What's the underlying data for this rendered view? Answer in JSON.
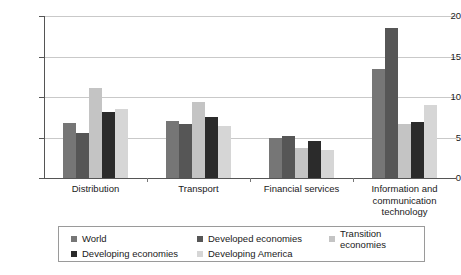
{
  "chart_data": {
    "type": "bar",
    "title": "",
    "xlabel": "",
    "ylabel": "",
    "ylim": [
      0,
      20
    ],
    "yticks": [
      0,
      5,
      10,
      15,
      20
    ],
    "grid": true,
    "legend_position": "bottom",
    "categories": [
      "Distribution",
      "Transport",
      "Financial services",
      "Information and communication technology"
    ],
    "category_lines": [
      [
        "Distribution"
      ],
      [
        "Transport"
      ],
      [
        "Financial services"
      ],
      [
        "Information and",
        "communication",
        "technology"
      ]
    ],
    "series": [
      {
        "name": "World",
        "color": "#767676",
        "values": [
          6.8,
          7.1,
          5.0,
          13.4
        ]
      },
      {
        "name": "Developed economies",
        "color": "#565656",
        "values": [
          5.6,
          6.7,
          5.2,
          18.5
        ]
      },
      {
        "name": "Transition economies",
        "color": "#c4c4c4",
        "values": [
          11.1,
          9.4,
          3.7,
          6.7
        ]
      },
      {
        "name": "Developing economies",
        "color": "#2b2b2b",
        "values": [
          8.2,
          7.5,
          4.6,
          6.9
        ]
      },
      {
        "name": "Developing America",
        "color": "#d6d6d6",
        "values": [
          8.5,
          6.4,
          3.4,
          9.0
        ]
      }
    ]
  },
  "legend": {
    "rows": [
      [
        {
          "label": "World",
          "color": "#767676"
        },
        {
          "label": "Developed economies",
          "color": "#565656"
        },
        {
          "label": "Transition economies",
          "color": "#c4c4c4"
        }
      ],
      [
        {
          "label": "Developing economies",
          "color": "#2b2b2b"
        },
        {
          "label": "Developing America",
          "color": "#d6d6d6"
        }
      ]
    ]
  }
}
